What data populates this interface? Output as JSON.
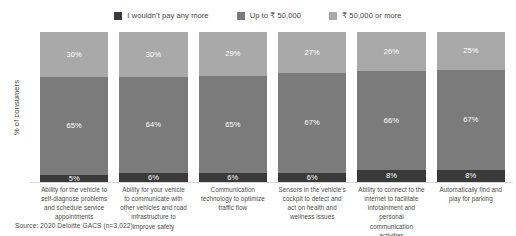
{
  "legend": {
    "position": "top-center",
    "items": [
      {
        "label": "I wouldn't pay any more",
        "color": "#3a3a3a",
        "swatch_icon": "square-swatch-icon"
      },
      {
        "label": "Up to ₹ 50,000",
        "color": "#7b7b7b",
        "swatch_icon": "square-swatch-icon"
      },
      {
        "label": "₹ 50,000 or more",
        "color": "#a9a9a9",
        "swatch_icon": "square-swatch-icon"
      }
    ]
  },
  "axes": {
    "ylabel": "% of consumers",
    "xlabel": ""
  },
  "source": "Source: 2020 Deloitte GACS (n=3,022)",
  "bars": [
    {
      "category": "Ability for the vehicle to self-diagnose problems and schedule service appointments",
      "segments": [
        {
          "series": "₹ 50,000 or more",
          "label": "30%",
          "value": 30,
          "color": "#a9a9a9"
        },
        {
          "series": "Up to ₹ 50,000",
          "label": "65%",
          "value": 65,
          "color": "#7b7b7b"
        },
        {
          "series": "I wouldn't pay any more",
          "label": "5%",
          "value": 5,
          "color": "#3a3a3a"
        }
      ]
    },
    {
      "category": "Ability for your vehicle to communicate with other vehicles and road infrastructure to improve safety",
      "segments": [
        {
          "series": "₹ 50,000 or more",
          "label": "30%",
          "value": 30,
          "color": "#a9a9a9"
        },
        {
          "series": "Up to ₹ 50,000",
          "label": "64%",
          "value": 64,
          "color": "#7b7b7b"
        },
        {
          "series": "I wouldn't pay any more",
          "label": "6%",
          "value": 6,
          "color": "#3a3a3a"
        }
      ]
    },
    {
      "category": "Communication technology to optimize traffic flow",
      "segments": [
        {
          "series": "₹ 50,000 or more",
          "label": "29%",
          "value": 29,
          "color": "#a9a9a9"
        },
        {
          "series": "Up to ₹ 50,000",
          "label": "65%",
          "value": 65,
          "color": "#7b7b7b"
        },
        {
          "series": "I wouldn't pay any more",
          "label": "6%",
          "value": 6,
          "color": "#3a3a3a"
        }
      ]
    },
    {
      "category": "Sensors in the vehicle's cockpit to detect and act on health and wellness issues",
      "segments": [
        {
          "series": "₹ 50,000 or more",
          "label": "27%",
          "value": 27,
          "color": "#a9a9a9"
        },
        {
          "series": "Up to ₹ 50,000",
          "label": "67%",
          "value": 67,
          "color": "#7b7b7b"
        },
        {
          "series": "I wouldn't pay any more",
          "label": "6%",
          "value": 6,
          "color": "#3a3a3a"
        }
      ]
    },
    {
      "category": "Ability to connect to the internet to facilitate infotainment and personal communication activities",
      "segments": [
        {
          "series": "₹ 50,000 or more",
          "label": "26%",
          "value": 26,
          "color": "#a9a9a9"
        },
        {
          "series": "Up to ₹ 50,000",
          "label": "66%",
          "value": 66,
          "color": "#7b7b7b"
        },
        {
          "series": "I wouldn't pay any more",
          "label": "8%",
          "value": 8,
          "color": "#3a3a3a"
        }
      ]
    },
    {
      "category": "Automatically find and play for parking",
      "segments": [
        {
          "series": "₹ 50,000 or more",
          "label": "25%",
          "value": 25,
          "color": "#a9a9a9"
        },
        {
          "series": "Up to ₹ 50,000",
          "label": "67%",
          "value": 67,
          "color": "#7b7b7b"
        },
        {
          "series": "I wouldn't pay any more",
          "label": "8%",
          "value": 8,
          "color": "#3a3a3a"
        }
      ]
    }
  ],
  "chart_data": {
    "type": "bar",
    "subtype": "stacked-vertical-100",
    "title": "",
    "subtitle": "",
    "xlabel": "",
    "ylabel": "% of consumers",
    "ylim": [
      0,
      100
    ],
    "grid": false,
    "legend_position": "top-center",
    "stack_order_top_to_bottom": [
      "₹ 50,000 or more",
      "Up to ₹ 50,000",
      "I wouldn't pay any more"
    ],
    "categories": [
      "Ability for the vehicle to self-diagnose problems and schedule service appointments",
      "Ability for your vehicle to communicate with other vehicles and road infrastructure to improve safety",
      "Communication technology to optimize traffic flow",
      "Sensors in the vehicle's cockpit to detect and act on health and wellness issues",
      "Ability to connect to the internet to facilitate infotainment and personal communication activities",
      "Automatically find and play for parking"
    ],
    "series": [
      {
        "name": "I wouldn't pay any more",
        "color": "#3a3a3a",
        "values": [
          5,
          6,
          6,
          6,
          8,
          8
        ]
      },
      {
        "name": "Up to ₹ 50,000",
        "color": "#7b7b7b",
        "values": [
          65,
          64,
          65,
          67,
          66,
          67
        ]
      },
      {
        "name": "₹ 50,000 or more",
        "color": "#a9a9a9",
        "values": [
          30,
          30,
          29,
          27,
          26,
          25
        ]
      }
    ],
    "annotations": [
      "Source: 2020 Deloitte GACS (n=3,022)"
    ]
  }
}
